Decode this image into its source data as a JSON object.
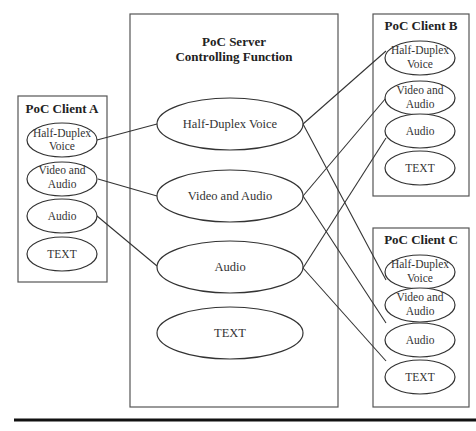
{
  "server": {
    "title_line1": "PoC Server",
    "title_line2": "Controlling Function",
    "functions": [
      {
        "label": "Half-Duplex Voice"
      },
      {
        "label": "Video and Audio"
      },
      {
        "label": "Audio"
      },
      {
        "label": "TEXT"
      }
    ]
  },
  "clients": [
    {
      "title": "PoC Client A",
      "functions": [
        {
          "line1": "Half-Duplex",
          "line2": "Voice"
        },
        {
          "line1": "Video and",
          "line2": "Audio"
        },
        {
          "line1": "Audio",
          "line2": ""
        },
        {
          "line1": "TEXT",
          "line2": ""
        }
      ]
    },
    {
      "title": "PoC Client B",
      "functions": [
        {
          "line1": "Half-Duplex",
          "line2": "Voice"
        },
        {
          "line1": "Video and",
          "line2": "Audio"
        },
        {
          "line1": "Audio",
          "line2": ""
        },
        {
          "line1": "TEXT",
          "line2": ""
        }
      ]
    },
    {
      "title": "PoC Client C",
      "functions": [
        {
          "line1": "Half-Duplex",
          "line2": "Voice"
        },
        {
          "line1": "Video and",
          "line2": "Audio"
        },
        {
          "line1": "Audio",
          "line2": ""
        },
        {
          "line1": "TEXT",
          "line2": ""
        }
      ]
    }
  ],
  "connections": [
    {
      "from": "Client A: Half-Duplex Voice",
      "to": "Server: Half-Duplex Voice"
    },
    {
      "from": "Client A: Video and Audio",
      "to": "Server: Video and Audio"
    },
    {
      "from": "Client A: Audio",
      "to": "Server: Audio"
    },
    {
      "from": "Server: Half-Duplex Voice",
      "to": "Client B: Half-Duplex Voice"
    },
    {
      "from": "Server: Half-Duplex Voice",
      "to": "Client C: Half-Duplex Voice"
    },
    {
      "from": "Server: Video and Audio",
      "to": "Client B: Video and Audio"
    },
    {
      "from": "Server: Video and Audio",
      "to": "Client C: Video and Audio"
    },
    {
      "from": "Server: Audio",
      "to": "Client B: Audio"
    },
    {
      "from": "Server: Audio",
      "to": "Client C: Audio"
    }
  ]
}
